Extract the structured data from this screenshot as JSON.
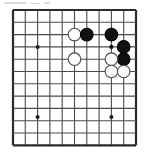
{
  "figure": {
    "kind": "go-board-diagram",
    "game": "Go",
    "caption": "",
    "board_label": "Go board corner diagram"
  },
  "board": {
    "columns": 11,
    "rows": 12,
    "origin_x": 13,
    "origin_y": 10,
    "spacing": 12.3,
    "line_color": "#4a4a4a",
    "line_width": 1.1,
    "edge_line_color": "#2b2b2b",
    "edge_line_width": 2.2,
    "background_color": "#ffffff",
    "edges": {
      "left": true,
      "top": true,
      "right": true,
      "bottom": true
    },
    "star_points": [
      {
        "col": 2,
        "row": 3
      },
      {
        "col": 2,
        "row": 8.7
      },
      {
        "col": 8,
        "row": 8.7
      }
    ],
    "star_point_radius": 2.0,
    "star_point_color": "#1a1a1a"
  },
  "stones": {
    "radius": 6.3,
    "black_fill": "#101010",
    "black_stroke": "#000000",
    "white_fill": "#fdfdfd",
    "white_stroke": "#4a4a4a",
    "stroke_width": 1.1,
    "list": [
      {
        "id": "w1",
        "color": "white",
        "col": 5,
        "row": 2,
        "label": ""
      },
      {
        "id": "b1",
        "color": "black",
        "col": 6,
        "row": 2,
        "label": ""
      },
      {
        "id": "b2",
        "color": "black",
        "col": 8,
        "row": 2,
        "label": ""
      },
      {
        "id": "b3",
        "color": "black",
        "col": 9,
        "row": 3,
        "label": ""
      },
      {
        "id": "b4",
        "color": "black",
        "col": 9,
        "row": 4,
        "label": ""
      },
      {
        "id": "w2",
        "color": "white",
        "col": 5,
        "row": 4,
        "label": ""
      },
      {
        "id": "w3",
        "color": "white",
        "col": 8,
        "row": 4,
        "label": ""
      },
      {
        "id": "w4",
        "color": "white",
        "col": 8,
        "row": 5,
        "label": ""
      },
      {
        "id": "w5",
        "color": "white",
        "col": 9,
        "row": 5,
        "label": ""
      }
    ]
  },
  "markers": [
    {
      "id": "m1",
      "type": "dot",
      "col": 8,
      "row": 3,
      "color": "#101010",
      "radius": 2.1
    }
  ],
  "scan_artifacts": {
    "top_smudges": [
      {
        "x": 4,
        "y": 2,
        "w": 22,
        "h": 2
      },
      {
        "x": 30,
        "y": 3,
        "w": 10,
        "h": 1
      },
      {
        "x": 44,
        "y": 2,
        "w": 6,
        "h": 2
      }
    ]
  }
}
